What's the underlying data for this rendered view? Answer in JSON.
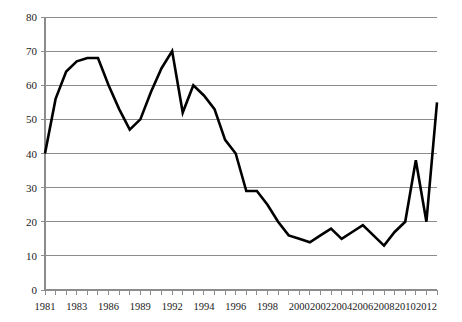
{
  "chart_data": {
    "type": "line",
    "title": "",
    "subtitle": "",
    "xlabel": "",
    "ylabel": "",
    "ylim": [
      0,
      80
    ],
    "ytick_step": 10,
    "yticks": [
      0,
      10,
      20,
      30,
      40,
      50,
      60,
      70,
      80
    ],
    "grid": true,
    "legend": false,
    "legend_position": "none",
    "line_color": "#000000",
    "grid_color": "#8c8c8c",
    "axis_color": "#8c8c8c",
    "text_color": "#1a1a1a",
    "background": "#ffffff",
    "x": [
      1981,
      1982,
      1983,
      1984,
      1985,
      1986,
      1987,
      1988,
      1989,
      1990,
      1991,
      1992,
      1993,
      1994,
      1995,
      1996,
      1997,
      1998,
      1999,
      2000,
      2001,
      2002,
      2003,
      2004,
      2005,
      2006,
      2007,
      2008,
      2009,
      2010,
      2011,
      2012,
      2013
    ],
    "values": [
      40,
      56,
      64,
      67,
      68,
      68,
      60,
      53,
      47,
      50,
      58,
      65,
      70,
      52,
      60,
      57,
      53,
      44,
      40,
      29,
      29,
      25,
      20,
      16,
      15,
      14,
      16,
      18,
      15,
      17,
      19,
      16,
      13
    ],
    "series": [
      {
        "name": "series-1",
        "values": [
          40,
          56,
          64,
          67,
          68,
          68,
          60,
          53,
          47,
          50,
          58,
          65,
          70,
          52,
          60,
          57,
          53,
          44,
          40,
          29,
          29,
          25,
          20,
          16,
          15,
          14,
          16,
          18,
          15,
          17,
          19,
          16,
          13
        ]
      }
    ],
    "points": [
      {
        "x": 1981,
        "y": 40
      },
      {
        "x": 1982,
        "y": 56
      },
      {
        "x": 1983,
        "y": 64
      },
      {
        "x": 1984,
        "y": 67
      },
      {
        "x": 1985,
        "y": 68
      },
      {
        "x": 1986,
        "y": 68
      },
      {
        "x": 1987,
        "y": 60
      },
      {
        "x": 1988,
        "y": 53
      },
      {
        "x": 1989,
        "y": 47
      },
      {
        "x": 1990,
        "y": 50
      },
      {
        "x": 1991,
        "y": 58
      },
      {
        "x": 1992,
        "y": 65
      },
      {
        "x": 1993,
        "y": 70
      },
      {
        "x": 1994,
        "y": 52
      },
      {
        "x": 1995,
        "y": 60
      },
      {
        "x": 1996,
        "y": 57
      },
      {
        "x": 1997,
        "y": 53
      },
      {
        "x": 1998,
        "y": 44
      },
      {
        "x": 1999,
        "y": 40
      },
      {
        "x": 2000,
        "y": 29
      },
      {
        "x": 2001,
        "y": 29
      },
      {
        "x": 2002,
        "y": 25
      },
      {
        "x": 2003,
        "y": 20
      },
      {
        "x": 2004,
        "y": 16
      },
      {
        "x": 2005,
        "y": 15
      },
      {
        "x": 2006,
        "y": 14
      },
      {
        "x": 2007,
        "y": 16
      },
      {
        "x": 2008,
        "y": 18
      },
      {
        "x": 2009,
        "y": 15
      },
      {
        "x": 2010,
        "y": 17
      },
      {
        "x": 2011,
        "y": 19
      },
      {
        "x": 2012,
        "y": 16
      },
      {
        "x": 2013,
        "y": 13
      },
      {
        "x": 2014,
        "y": 17
      },
      {
        "x": 2015,
        "y": 20
      },
      {
        "x": 2016,
        "y": 38
      },
      {
        "x": 2017,
        "y": 20
      },
      {
        "x": 2018,
        "y": 55
      }
    ],
    "plot_series_values": [
      40,
      56,
      64,
      67,
      68,
      68,
      60,
      53,
      47,
      50,
      58,
      65,
      70,
      52,
      60,
      57,
      53,
      44,
      40,
      29,
      29,
      25,
      20,
      16,
      15,
      14,
      16,
      18,
      15,
      17,
      19,
      16,
      13,
      17,
      20,
      38,
      20,
      55
    ],
    "xtick_count": 38,
    "xtick_labels": [
      {
        "index": 0,
        "label": "1981"
      },
      {
        "index": 3,
        "label": "1983"
      },
      {
        "index": 6,
        "label": "1986"
      },
      {
        "index": 9,
        "label": "1989"
      },
      {
        "index": 12,
        "label": "1992"
      },
      {
        "index": 15,
        "label": "1994"
      },
      {
        "index": 18,
        "label": "1996"
      },
      {
        "index": 21,
        "label": "1998"
      },
      {
        "index": 24,
        "label": "2000"
      },
      {
        "index": 26,
        "label": "2002"
      },
      {
        "index": 28,
        "label": "2004"
      },
      {
        "index": 30,
        "label": "2006"
      },
      {
        "index": 32,
        "label": "2008"
      },
      {
        "index": 34,
        "label": "2010"
      },
      {
        "index": 36,
        "label": "2012"
      }
    ]
  }
}
